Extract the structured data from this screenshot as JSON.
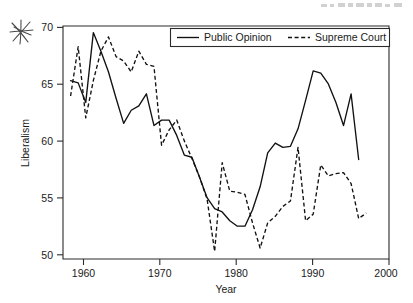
{
  "figure": {
    "annotation_mark": "hand-drawn-asterisk-scribble",
    "header_smudge": "faint-cropped-header-text"
  },
  "chart_data": {
    "type": "line",
    "title": "",
    "xlabel": "Year",
    "ylabel": "Liberalism",
    "xlim": [
      1957,
      2000
    ],
    "ylim": [
      49.3,
      70.6
    ],
    "xticks": [
      1960,
      1970,
      1980,
      1990,
      2000
    ],
    "yticks": [
      50,
      55,
      60,
      65,
      70
    ],
    "xticklabels": [
      "1960",
      "1970",
      "1980",
      "1990",
      "2000"
    ],
    "yticklabels": [
      "50",
      "55",
      "60",
      "65",
      "70"
    ],
    "grid": false,
    "legend_position": "upper center",
    "series": [
      {
        "name": "Public Opinion",
        "style": "solid",
        "x": [
          1958,
          1959,
          1960,
          1961,
          1962,
          1963,
          1964,
          1965,
          1966,
          1967,
          1968,
          1969,
          1970,
          1971,
          1972,
          1973,
          1974,
          1975,
          1976,
          1977,
          1978,
          1979,
          1980,
          1981,
          1982,
          1983,
          1984,
          1985,
          1986,
          1987,
          1988,
          1989,
          1990,
          1991,
          1992,
          1993,
          1994,
          1995,
          1996
        ],
        "y": [
          65.6,
          65.4,
          63.6,
          70.0,
          68.3,
          66.4,
          64.0,
          61.7,
          62.9,
          63.3,
          64.4,
          61.5,
          62.0,
          62.0,
          60.6,
          58.8,
          58.6,
          56.8,
          54.9,
          53.9,
          53.6,
          52.8,
          52.3,
          52.3,
          53.8,
          55.9,
          59.0,
          59.9,
          59.5,
          59.6,
          61.2,
          63.8,
          66.5,
          66.3,
          65.3,
          63.6,
          61.5,
          64.4,
          58.4
        ]
      },
      {
        "name": "Supreme Court",
        "style": "dashed",
        "x": [
          1958,
          1959,
          1960,
          1961,
          1962,
          1963,
          1964,
          1965,
          1966,
          1967,
          1968,
          1969,
          1970,
          1971,
          1972,
          1973,
          1974,
          1975,
          1976,
          1977,
          1978,
          1979,
          1980,
          1981,
          1982,
          1983,
          1984,
          1985,
          1986,
          1987,
          1988,
          1989,
          1990,
          1991,
          1992,
          1993,
          1994,
          1995,
          1996,
          1997
        ],
        "y": [
          64.2,
          68.7,
          62.2,
          65.6,
          68.3,
          69.6,
          67.8,
          67.4,
          66.4,
          68.3,
          67.1,
          66.9,
          59.7,
          61.1,
          62.0,
          60.1,
          58.5,
          56.8,
          54.8,
          50.0,
          58.1,
          55.5,
          55.4,
          55.2,
          52.6,
          50.3,
          52.6,
          53.2,
          54.1,
          54.6,
          59.5,
          52.8,
          53.4,
          57.9,
          56.9,
          57.1,
          57.2,
          56.2,
          53.0,
          53.5
        ]
      }
    ]
  }
}
